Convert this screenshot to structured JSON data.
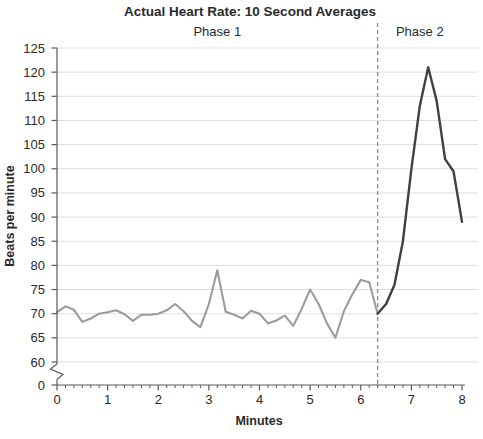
{
  "chart_data": {
    "type": "line",
    "title": "Actual Heart Rate: 10 Second Averages",
    "xlabel": "Minutes",
    "ylabel": "Beats per minute",
    "grid": true,
    "legend": "none",
    "x_axis": {
      "min": 0,
      "max": 8,
      "major_ticks": [
        0,
        1,
        2,
        3,
        4,
        5,
        6,
        7,
        8
      ],
      "minor_tick_step_minutes": 0.1667,
      "unit": "minutes"
    },
    "y_axis": {
      "display_min": 60,
      "display_max": 125,
      "tick_step": 5,
      "tick_values": [
        125,
        120,
        115,
        110,
        105,
        100,
        95,
        90,
        85,
        80,
        75,
        70,
        65,
        60,
        0
      ],
      "axis_break_between": [
        0,
        60
      ],
      "unit": "beats per minute"
    },
    "divider_x": 6.333,
    "divider_style": "dashed",
    "phases": [
      {
        "label": "Phase 1",
        "x_range": [
          0,
          6.333
        ]
      },
      {
        "label": "Phase 2",
        "x_range": [
          6.333,
          8
        ]
      }
    ],
    "series": [
      {
        "name": "Phase 1 heart rate (10 s averages)",
        "color": "#9c9c9c",
        "x": [
          0,
          0.167,
          0.333,
          0.5,
          0.667,
          0.833,
          1,
          1.167,
          1.333,
          1.5,
          1.667,
          1.833,
          2,
          2.167,
          2.333,
          2.5,
          2.667,
          2.833,
          3,
          3.167,
          3.333,
          3.5,
          3.667,
          3.833,
          4,
          4.167,
          4.333,
          4.5,
          4.667,
          4.833,
          5,
          5.167,
          5.333,
          5.5,
          5.667,
          5.833,
          6,
          6.167,
          6.333
        ],
        "y": [
          70.3,
          71.5,
          70.8,
          68.3,
          69,
          70,
          70.3,
          70.7,
          69.9,
          68.5,
          69.8,
          69.8,
          70,
          70.7,
          72,
          70.5,
          68.5,
          67.2,
          72,
          79,
          70.4,
          69.8,
          69,
          70.6,
          70,
          68,
          68.6,
          69.6,
          67.5,
          71,
          75,
          72,
          68,
          65,
          70.5,
          74,
          77,
          76.5,
          70
        ]
      },
      {
        "name": "Phase 2 heart rate (10 s averages)",
        "color": "#404040",
        "x": [
          6.333,
          6.5,
          6.667,
          6.833,
          7,
          7.167,
          7.333,
          7.5,
          7.667,
          7.833,
          8
        ],
        "y": [
          70,
          72,
          76,
          85,
          100,
          113,
          121,
          114,
          102,
          99.5,
          89
        ]
      }
    ]
  },
  "colors": {
    "background": "#ffffff",
    "gridline": "#dfdfdf",
    "axis": "#5a5a5a",
    "divider": "#8a8a8a",
    "text": "#2a2a2a",
    "phase1_line": "#9c9c9c",
    "phase2_line": "#404040"
  }
}
